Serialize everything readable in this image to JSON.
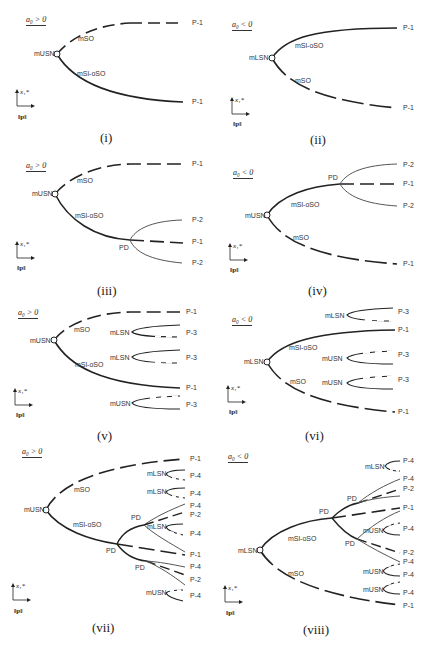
{
  "figure": {
    "axis_labels": {
      "y": "x₁*",
      "x": "‖p‖"
    },
    "line_color_main": "#222222",
    "line_color_branch": "#555555",
    "panels": [
      {
        "caption": "(i)",
        "condition": "a₀ > 0",
        "node": "mUSN",
        "branches": [
          {
            "label": "mSO",
            "style": "dashed",
            "end": "P-1"
          },
          {
            "label": "mSl-oSO",
            "style": "solid",
            "end": "P-1"
          }
        ]
      },
      {
        "caption": "(ii)",
        "condition": "a₀ < 0",
        "node": "mLSN",
        "branches": [
          {
            "label": "mSl-oSO",
            "style": "solid",
            "end": "P-1"
          },
          {
            "label": "mSO",
            "style": "dashed",
            "end": "P-1"
          }
        ]
      },
      {
        "caption": "(iii)",
        "condition": "a₀ > 0",
        "node": "mUSN",
        "branches": [
          {
            "label": "mSO",
            "style": "dashed",
            "end": "P-1"
          },
          {
            "label": "mSl-oSO",
            "style": "solid",
            "end": "PD"
          }
        ],
        "pd": {
          "label": "PD",
          "ends": [
            "P-2",
            "P-1",
            "P-2"
          ]
        }
      },
      {
        "caption": "(iv)",
        "condition": "a₀ < 0",
        "node": "mUSN",
        "branches": [
          {
            "label": "mSl-oSO",
            "style": "solid",
            "end": "PD"
          },
          {
            "label": "mSO",
            "style": "dashed",
            "end": "P-1"
          }
        ],
        "pd": {
          "label": "PD",
          "ends": [
            "P-2",
            "P-1",
            "P-2"
          ]
        }
      },
      {
        "caption": "(v)",
        "condition": "a₀ > 0",
        "node": "mUSN",
        "branches": [
          {
            "label": "mSO",
            "style": "dashed",
            "end": "P-1"
          },
          {
            "label": "mSl-oSO",
            "style": "solid",
            "end": "P-1"
          }
        ],
        "isolas": [
          {
            "node": "mLSN",
            "end": "P-3"
          },
          {
            "node": "mLSN",
            "end": "P-3"
          },
          {
            "node": "mUSN",
            "end": "P-3"
          }
        ]
      },
      {
        "caption": "(vi)",
        "condition": "a₀ < 0",
        "node": "mLSN",
        "branches": [
          {
            "label": "mSl-oSO",
            "style": "solid",
            "end": "P-1"
          },
          {
            "label": "mSO",
            "style": "dashed",
            "end": "P-1"
          }
        ],
        "isolas": [
          {
            "node": "mLSN",
            "end": "P-3"
          },
          {
            "node": "mUSN",
            "end": "P-3"
          },
          {
            "node": "mUSN",
            "end": "P-3"
          }
        ]
      },
      {
        "caption": "(vii)",
        "condition": "a₀ > 0",
        "node": "mUSN",
        "branches": [
          {
            "label": "mSO",
            "style": "dashed",
            "end": "P-1"
          },
          {
            "label": "mSl-oSO",
            "style": "solid",
            "end": "PD"
          }
        ],
        "pd_labels": [
          "PD",
          "PD",
          "PD"
        ],
        "isola_labels": [
          "mLSN",
          "mLSN",
          "mLSN",
          "mUSN"
        ],
        "ends": [
          "P-1",
          "P-4",
          "P-4",
          "P-4",
          "P-2",
          "P-4",
          "P-1",
          "P-4",
          "P-2",
          "P-4"
        ]
      },
      {
        "caption": "(viii)",
        "condition": "a₀ < 0",
        "node": "mLSN",
        "branches": [
          {
            "label": "mSl-oSO",
            "style": "solid",
            "end": "PD"
          },
          {
            "label": "mSO",
            "style": "dashed",
            "end": "P-1"
          }
        ],
        "pd_labels": [
          "PD",
          "PD",
          "PD"
        ],
        "isola_labels": [
          "mLSN",
          "mUSN",
          "mUSN",
          "mUSN"
        ],
        "ends": [
          "P-4",
          "P-4",
          "P-2",
          "P-1",
          "P-4",
          "P-2",
          "P-4",
          "P-4",
          "P-4",
          "P-1"
        ]
      }
    ]
  }
}
